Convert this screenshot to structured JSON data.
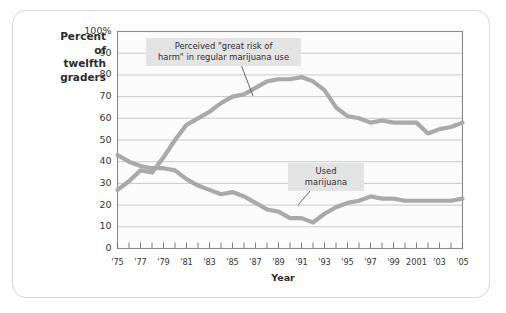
{
  "figure": {
    "y_axis_title_lines": [
      "Percent",
      "of",
      "twelfth",
      "graders"
    ],
    "x_axis_title": "Year"
  },
  "annotations": {
    "risk_label": "Perceived \"great risk of\nharm\" in regular marijuana use",
    "use_label": "Used marijuana"
  },
  "colors": {
    "line": "#a9a9a9",
    "annotation_bg": "#e3e3e3",
    "grid": "#bdbdbd",
    "frame": "#8a8a8a",
    "card_border": "#d8d8d8"
  },
  "chart_data": {
    "type": "line",
    "title": "",
    "xlabel": "Year",
    "ylabel": "Percent of twelfth graders",
    "xlim": [
      1975,
      2005
    ],
    "ylim": [
      0,
      100
    ],
    "grid": true,
    "legend": "none (inline annotations)",
    "ytick_labels": [
      "0",
      "10",
      "20",
      "30",
      "40",
      "50",
      "60",
      "70",
      "80",
      "90",
      "100%"
    ],
    "ytick_values": [
      0,
      10,
      20,
      30,
      40,
      50,
      60,
      70,
      80,
      90,
      100
    ],
    "xtick_values": [
      1975,
      1976,
      1977,
      1978,
      1979,
      1980,
      1981,
      1982,
      1983,
      1984,
      1985,
      1986,
      1987,
      1988,
      1989,
      1990,
      1991,
      1992,
      1993,
      1994,
      1995,
      1996,
      1997,
      1998,
      1999,
      2000,
      2001,
      2002,
      2003,
      2004,
      2005
    ],
    "xtick_labels": [
      {
        "value": 1975,
        "label": "'75"
      },
      {
        "value": 1977,
        "label": "'77"
      },
      {
        "value": 1979,
        "label": "'79"
      },
      {
        "value": 1981,
        "label": "'81"
      },
      {
        "value": 1983,
        "label": "'83"
      },
      {
        "value": 1985,
        "label": "'85"
      },
      {
        "value": 1987,
        "label": "'87"
      },
      {
        "value": 1989,
        "label": "'89"
      },
      {
        "value": 1991,
        "label": "'91"
      },
      {
        "value": 1993,
        "label": "'93"
      },
      {
        "value": 1995,
        "label": "'95"
      },
      {
        "value": 1997,
        "label": "'97"
      },
      {
        "value": 1999,
        "label": "'99"
      },
      {
        "value": 2001,
        "label": "2001"
      },
      {
        "value": 2003,
        "label": "'03"
      },
      {
        "value": 2005,
        "label": "'05"
      }
    ],
    "x": [
      1975,
      1976,
      1977,
      1978,
      1979,
      1980,
      1981,
      1982,
      1983,
      1984,
      1985,
      1986,
      1987,
      1988,
      1989,
      1990,
      1991,
      1992,
      1993,
      1994,
      1995,
      1996,
      1997,
      1998,
      1999,
      2000,
      2001,
      2002,
      2003,
      2004,
      2005
    ],
    "series": [
      {
        "name": "Perceived \"great risk of harm\" in regular marijuana use",
        "values": [
          27,
          31,
          36,
          35,
          42,
          50,
          57,
          60,
          63,
          67,
          70,
          71,
          74,
          77,
          78,
          78,
          79,
          77,
          73,
          65,
          61,
          60,
          58,
          59,
          58,
          58,
          58,
          53,
          55,
          56,
          58
        ]
      },
      {
        "name": "Used marijuana",
        "values": [
          43,
          40,
          38,
          37,
          37,
          36,
          32,
          29,
          27,
          25,
          26,
          24,
          21,
          18,
          17,
          14,
          14,
          12,
          16,
          19,
          21,
          22,
          24,
          23,
          23,
          22,
          22,
          22,
          22,
          22,
          23
        ]
      }
    ]
  }
}
